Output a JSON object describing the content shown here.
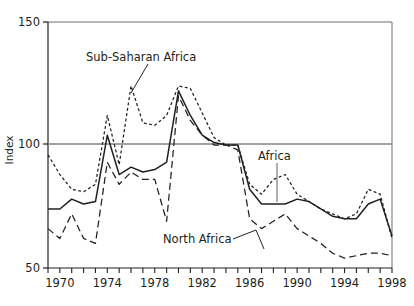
{
  "chart_data": {
    "type": "line",
    "title": "",
    "xlabel": "",
    "ylabel": "Index",
    "xlim": [
      1969,
      1998
    ],
    "ylim": [
      50,
      150
    ],
    "yticks": [
      50,
      100,
      150
    ],
    "ytick_labels": [
      "50",
      "100",
      "150"
    ],
    "xticks": [
      1969,
      1970,
      1971,
      1972,
      1973,
      1974,
      1975,
      1976,
      1977,
      1978,
      1979,
      1980,
      1981,
      1982,
      1983,
      1984,
      1985,
      1986,
      1987,
      1988,
      1989,
      1990,
      1991,
      1992,
      1993,
      1994,
      1995,
      1996,
      1997,
      1998
    ],
    "xtick_labels_shown": [
      "1970",
      "1974",
      "1978",
      "1982",
      "1986",
      "1990",
      "1994",
      "1998"
    ],
    "xtick_labels_years": [
      1970,
      1974,
      1978,
      1982,
      1986,
      1990,
      1994,
      1998
    ],
    "gridlines": {
      "y": [
        100
      ],
      "x": []
    },
    "grid": "single horizontal reference line at 100",
    "legend_position": "inline annotations with leader lines",
    "x": [
      1969,
      1970,
      1971,
      1972,
      1973,
      1974,
      1975,
      1976,
      1977,
      1978,
      1979,
      1980,
      1981,
      1982,
      1983,
      1984,
      1985,
      1986,
      1987,
      1988,
      1989,
      1990,
      1991,
      1992,
      1993,
      1994,
      1995,
      1996,
      1997,
      1998
    ],
    "series": [
      {
        "name": "Africa",
        "style": "solid",
        "values": [
          74,
          74,
          78,
          76,
          77,
          104,
          88,
          91,
          89,
          90,
          93,
          122,
          112,
          104,
          101,
          100,
          100,
          82,
          76,
          76,
          76,
          78,
          77,
          74,
          71,
          70,
          70,
          76,
          78,
          63
        ]
      },
      {
        "name": "Sub-Saharan Africa",
        "style": "short-dash",
        "values": [
          96,
          88,
          82,
          81,
          84,
          112,
          92,
          124,
          109,
          108,
          112,
          124,
          123,
          113,
          103,
          100,
          100,
          84,
          80,
          86,
          88,
          80,
          77,
          74,
          72,
          70,
          72,
          82,
          80,
          62
        ]
      },
      {
        "name": "North Africa",
        "style": "long-dash",
        "values": [
          66,
          62,
          72,
          62,
          60,
          93,
          84,
          89,
          86,
          86,
          69,
          120,
          110,
          104,
          100,
          100,
          98,
          70,
          66,
          69,
          72,
          66,
          63,
          60,
          56,
          54,
          55,
          56,
          56,
          55
        ]
      }
    ],
    "annotations": [
      {
        "text": "Sub-Saharan Africa",
        "x_px": 86,
        "y_px": 58,
        "leader": "down-right"
      },
      {
        "text": "Africa",
        "x_px": 258,
        "y_px": 157,
        "leader": "down"
      },
      {
        "text": "North Africa",
        "x_px": 170,
        "y_px": 243,
        "leader": "up-right"
      }
    ]
  },
  "axes": {
    "y_title": "Index",
    "y_labels": [
      "150",
      "100",
      "50"
    ],
    "x_labels": [
      "1970",
      "1974",
      "1978",
      "1982",
      "1986",
      "1990",
      "1994",
      "1998"
    ]
  },
  "labels": {
    "sub_saharan_africa": "Sub-Saharan Africa",
    "africa": "Africa",
    "north_africa": "North Africa"
  },
  "colors": {
    "ink": "#231f20",
    "axis": "#6d6e71",
    "gridline": "#808285",
    "background": "#ffffff"
  }
}
